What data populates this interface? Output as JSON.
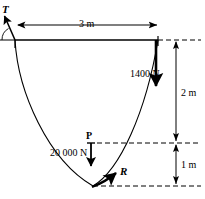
{
  "diagram": {
    "colors": {
      "stroke": "#000000",
      "background": "#ffffff"
    },
    "dimensions": {
      "span": "3 m",
      "sag_upper": "2 m",
      "sag_lower": "1 m"
    },
    "forces": {
      "load_right": "1400 N",
      "load_mid": "20 000 N",
      "point_label": "P",
      "tension_label": "T",
      "reaction_label": "R"
    },
    "icons": {
      "arrow_left": "arrow-left-icon",
      "arrow_right": "arrow-right-icon",
      "arrow_down": "arrow-down-icon",
      "arrow_up": "arrow-up-icon",
      "curved_arrow": "curved-arrow-icon",
      "angle_arc": "angle-arc-icon"
    }
  }
}
